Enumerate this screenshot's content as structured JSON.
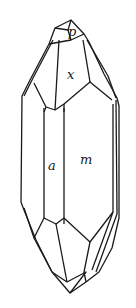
{
  "diagram": {
    "type": "crystal-drawing",
    "face_labels": {
      "p": "p",
      "x": "x",
      "a": "a",
      "m": "m"
    }
  }
}
